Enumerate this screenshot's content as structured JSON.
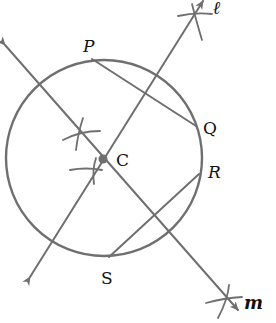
{
  "figure": {
    "colors": {
      "stroke": "#6f6f6f",
      "label": "#111111",
      "background": "#ffffff"
    }
  },
  "circle": {
    "cx": 104,
    "cy": 158,
    "r": 98
  },
  "center": {
    "label": "C",
    "x": 103,
    "y": 159
  },
  "points": [
    {
      "label": "P",
      "x": 92,
      "y": 59
    },
    {
      "label": "Q",
      "x": 196,
      "y": 126
    },
    {
      "label": "R",
      "x": 199,
      "y": 174
    },
    {
      "label": "S",
      "x": 109,
      "y": 257
    }
  ],
  "chords": [
    {
      "name": "PQ",
      "from": "P",
      "to": "Q"
    },
    {
      "name": "RS",
      "from": "R",
      "to": "S"
    }
  ],
  "lines": [
    {
      "label": "ℓ",
      "name": "perpendicular-bisector-RS",
      "from": [
        30,
        277
      ],
      "to": [
        203,
        1
      ]
    },
    {
      "label": "m",
      "name": "perpendicular-bisector-PQ",
      "from": [
        5,
        45
      ],
      "to": [
        238,
        310
      ]
    }
  ],
  "labels": {
    "P": "P",
    "Q": "Q",
    "R": "R",
    "S": "S",
    "C": "C",
    "l": "ℓ",
    "m": "m"
  }
}
